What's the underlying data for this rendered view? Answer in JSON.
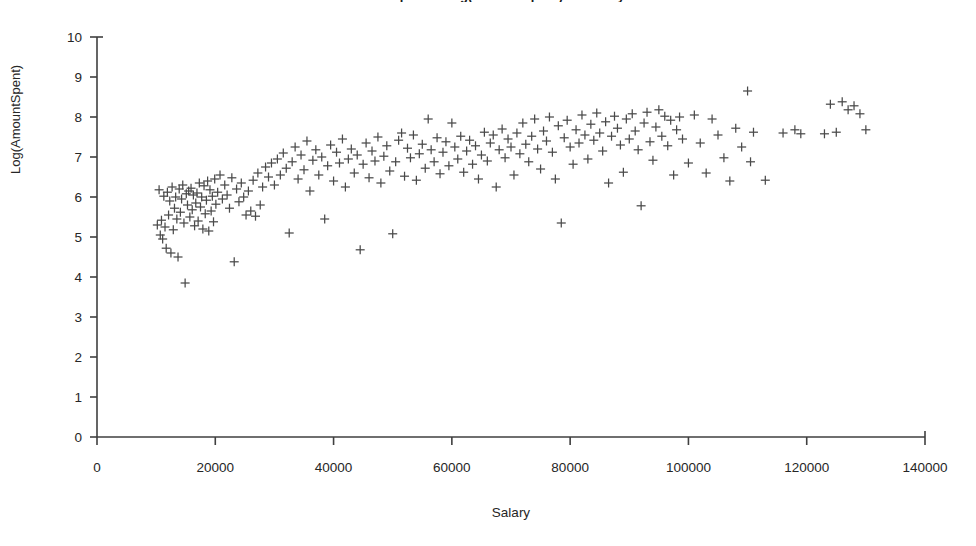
{
  "chart_data": {
    "type": "scatter",
    "title": "Scatter plot of Log(AmountSpent) vs Salary",
    "xlabel": "Salary",
    "ylabel": "Log(AmountSpent)",
    "xlim": [
      0,
      140000
    ],
    "ylim": [
      0,
      10
    ],
    "xticks": [
      "0",
      "20000",
      "40000",
      "60000",
      "80000",
      "100000",
      "120000",
      "140000"
    ],
    "xtick_values": [
      0,
      20000,
      40000,
      60000,
      80000,
      100000,
      120000,
      140000
    ],
    "yticks": [
      "0",
      "1",
      "2",
      "3",
      "4",
      "5",
      "6",
      "7",
      "8",
      "9",
      "10"
    ],
    "ytick_values": [
      0,
      1,
      2,
      3,
      4,
      5,
      6,
      7,
      8,
      9,
      10
    ],
    "grid": false,
    "legend": false,
    "marker": "plus",
    "marker_color": "#4a4a4a",
    "marker_size": 9,
    "series": [
      {
        "name": "Log(AmountSpent)",
        "points": [
          [
            10200,
            5.3
          ],
          [
            10500,
            6.18
          ],
          [
            10700,
            5.05
          ],
          [
            10900,
            5.42
          ],
          [
            11100,
            4.95
          ],
          [
            11300,
            6.02
          ],
          [
            11500,
            5.25
          ],
          [
            11700,
            4.72
          ],
          [
            11900,
            6.12
          ],
          [
            12100,
            5.55
          ],
          [
            12300,
            5.9
          ],
          [
            12500,
            4.6
          ],
          [
            12700,
            6.25
          ],
          [
            12900,
            5.18
          ],
          [
            13100,
            5.72
          ],
          [
            13300,
            6.0
          ],
          [
            13500,
            5.45
          ],
          [
            13700,
            4.5
          ],
          [
            13900,
            6.2
          ],
          [
            14100,
            5.62
          ],
          [
            14300,
            5.95
          ],
          [
            14500,
            6.3
          ],
          [
            14700,
            5.35
          ],
          [
            14900,
            3.85
          ],
          [
            15100,
            6.08
          ],
          [
            15300,
            5.8
          ],
          [
            15500,
            6.15
          ],
          [
            15700,
            5.5
          ],
          [
            15900,
            6.22
          ],
          [
            16100,
            5.68
          ],
          [
            16300,
            6.05
          ],
          [
            16500,
            5.28
          ],
          [
            16700,
            5.85
          ],
          [
            16900,
            6.1
          ],
          [
            17100,
            5.4
          ],
          [
            17300,
            6.35
          ],
          [
            17500,
            5.75
          ],
          [
            17700,
            6.0
          ],
          [
            17900,
            5.2
          ],
          [
            18100,
            6.28
          ],
          [
            18300,
            5.58
          ],
          [
            18500,
            5.92
          ],
          [
            18700,
            6.4
          ],
          [
            18900,
            5.15
          ],
          [
            19100,
            6.18
          ],
          [
            19300,
            5.65
          ],
          [
            19500,
            6.02
          ],
          [
            19700,
            5.38
          ],
          [
            19900,
            6.45
          ],
          [
            20100,
            5.82
          ],
          [
            20400,
            6.12
          ],
          [
            20800,
            6.55
          ],
          [
            21200,
            5.95
          ],
          [
            21600,
            6.3
          ],
          [
            22000,
            6.05
          ],
          [
            22400,
            5.72
          ],
          [
            22800,
            6.48
          ],
          [
            23200,
            4.38
          ],
          [
            23600,
            6.2
          ],
          [
            24000,
            5.88
          ],
          [
            24400,
            6.35
          ],
          [
            24800,
            6.0
          ],
          [
            25200,
            5.55
          ],
          [
            25600,
            6.15
          ],
          [
            26000,
            5.65
          ],
          [
            26400,
            6.42
          ],
          [
            26800,
            5.52
          ],
          [
            27200,
            6.6
          ],
          [
            27600,
            5.8
          ],
          [
            28000,
            6.25
          ],
          [
            28500,
            6.75
          ],
          [
            29000,
            6.5
          ],
          [
            29500,
            6.85
          ],
          [
            30000,
            6.3
          ],
          [
            30500,
            6.95
          ],
          [
            31000,
            6.55
          ],
          [
            31500,
            7.1
          ],
          [
            32000,
            6.72
          ],
          [
            32500,
            5.1
          ],
          [
            33000,
            6.88
          ],
          [
            33500,
            7.25
          ],
          [
            34000,
            6.45
          ],
          [
            34500,
            7.05
          ],
          [
            35000,
            6.68
          ],
          [
            35500,
            7.4
          ],
          [
            36000,
            6.15
          ],
          [
            36500,
            6.92
          ],
          [
            37000,
            7.18
          ],
          [
            37500,
            6.55
          ],
          [
            38000,
            7.0
          ],
          [
            38500,
            5.45
          ],
          [
            39000,
            6.78
          ],
          [
            39500,
            7.3
          ],
          [
            40000,
            6.4
          ],
          [
            40500,
            7.12
          ],
          [
            41000,
            6.85
          ],
          [
            41500,
            7.45
          ],
          [
            42000,
            6.25
          ],
          [
            42500,
            6.95
          ],
          [
            43000,
            7.2
          ],
          [
            43500,
            6.6
          ],
          [
            44000,
            7.05
          ],
          [
            44500,
            4.68
          ],
          [
            45000,
            6.82
          ],
          [
            45500,
            7.35
          ],
          [
            46000,
            6.48
          ],
          [
            46500,
            7.15
          ],
          [
            47000,
            6.9
          ],
          [
            47500,
            7.5
          ],
          [
            48000,
            6.35
          ],
          [
            48500,
            7.02
          ],
          [
            49000,
            7.28
          ],
          [
            49500,
            6.65
          ],
          [
            50000,
            5.08
          ],
          [
            50500,
            6.88
          ],
          [
            51000,
            7.42
          ],
          [
            51500,
            7.6
          ],
          [
            52000,
            6.52
          ],
          [
            52500,
            7.22
          ],
          [
            53000,
            6.98
          ],
          [
            53500,
            7.55
          ],
          [
            54000,
            6.42
          ],
          [
            54500,
            7.08
          ],
          [
            55000,
            7.32
          ],
          [
            55500,
            6.72
          ],
          [
            56000,
            7.95
          ],
          [
            56500,
            7.18
          ],
          [
            57000,
            6.88
          ],
          [
            57500,
            7.48
          ],
          [
            58000,
            6.58
          ],
          [
            58500,
            7.12
          ],
          [
            59000,
            7.38
          ],
          [
            59500,
            6.78
          ],
          [
            60000,
            7.85
          ],
          [
            60500,
            7.25
          ],
          [
            61000,
            6.95
          ],
          [
            61500,
            7.52
          ],
          [
            62000,
            6.62
          ],
          [
            62500,
            7.15
          ],
          [
            63000,
            7.42
          ],
          [
            63500,
            6.82
          ],
          [
            64000,
            7.28
          ],
          [
            64500,
            6.45
          ],
          [
            65000,
            7.05
          ],
          [
            65500,
            7.62
          ],
          [
            66000,
            6.9
          ],
          [
            66500,
            7.35
          ],
          [
            67000,
            7.55
          ],
          [
            67500,
            6.25
          ],
          [
            68000,
            7.18
          ],
          [
            68500,
            7.7
          ],
          [
            69000,
            6.98
          ],
          [
            69500,
            7.45
          ],
          [
            70000,
            7.25
          ],
          [
            70500,
            6.55
          ],
          [
            71000,
            7.6
          ],
          [
            71500,
            7.08
          ],
          [
            72000,
            7.85
          ],
          [
            72500,
            7.32
          ],
          [
            73000,
            6.88
          ],
          [
            73500,
            7.52
          ],
          [
            74000,
            7.95
          ],
          [
            74500,
            7.2
          ],
          [
            75000,
            6.7
          ],
          [
            75500,
            7.65
          ],
          [
            76000,
            7.4
          ],
          [
            76500,
            8.0
          ],
          [
            77000,
            7.12
          ],
          [
            77500,
            6.45
          ],
          [
            78000,
            7.78
          ],
          [
            78500,
            5.35
          ],
          [
            79000,
            7.48
          ],
          [
            79500,
            7.92
          ],
          [
            80000,
            7.25
          ],
          [
            80500,
            6.82
          ],
          [
            81000,
            7.68
          ],
          [
            81500,
            7.35
          ],
          [
            82000,
            8.05
          ],
          [
            82500,
            7.55
          ],
          [
            83000,
            6.95
          ],
          [
            83500,
            7.82
          ],
          [
            84000,
            7.42
          ],
          [
            84500,
            8.1
          ],
          [
            85000,
            7.6
          ],
          [
            85500,
            7.15
          ],
          [
            86000,
            7.88
          ],
          [
            86500,
            6.35
          ],
          [
            87000,
            7.52
          ],
          [
            87500,
            8.02
          ],
          [
            88000,
            7.72
          ],
          [
            88500,
            7.3
          ],
          [
            89000,
            6.62
          ],
          [
            89500,
            7.95
          ],
          [
            90000,
            7.45
          ],
          [
            90500,
            8.08
          ],
          [
            91000,
            7.65
          ],
          [
            91500,
            7.18
          ],
          [
            92000,
            5.78
          ],
          [
            92500,
            7.85
          ],
          [
            93000,
            8.12
          ],
          [
            93500,
            7.38
          ],
          [
            94000,
            6.92
          ],
          [
            94500,
            7.75
          ],
          [
            95000,
            8.18
          ],
          [
            95500,
            7.52
          ],
          [
            96000,
            8.02
          ],
          [
            96500,
            7.28
          ],
          [
            97000,
            7.92
          ],
          [
            97500,
            6.55
          ],
          [
            98000,
            7.68
          ],
          [
            98500,
            8.0
          ],
          [
            99000,
            7.45
          ],
          [
            100000,
            6.85
          ],
          [
            101000,
            8.05
          ],
          [
            102000,
            7.35
          ],
          [
            103000,
            6.6
          ],
          [
            104000,
            7.95
          ],
          [
            105000,
            7.55
          ],
          [
            106000,
            6.98
          ],
          [
            107000,
            6.4
          ],
          [
            108000,
            7.72
          ],
          [
            109000,
            7.25
          ],
          [
            110000,
            8.65
          ],
          [
            110500,
            6.88
          ],
          [
            111000,
            7.62
          ],
          [
            113000,
            6.42
          ],
          [
            116000,
            7.6
          ],
          [
            118000,
            7.68
          ],
          [
            119000,
            7.58
          ],
          [
            123000,
            7.58
          ],
          [
            124000,
            8.32
          ],
          [
            125000,
            7.62
          ],
          [
            126000,
            8.38
          ],
          [
            127000,
            8.18
          ],
          [
            128000,
            8.28
          ],
          [
            129000,
            8.08
          ],
          [
            130000,
            7.68
          ]
        ]
      }
    ]
  }
}
